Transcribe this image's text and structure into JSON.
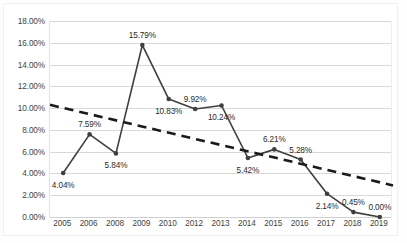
{
  "chart_data": {
    "type": "line",
    "title": "",
    "xlabel": "",
    "ylabel": "",
    "categories": [
      "2005",
      "2006",
      "2008",
      "2009",
      "2010",
      "2012",
      "2013",
      "2014",
      "2015",
      "2016",
      "2017",
      "2018",
      "2019"
    ],
    "values": [
      4.04,
      7.59,
      5.84,
      15.79,
      10.83,
      9.92,
      10.24,
      5.42,
      6.21,
      5.28,
      2.14,
      0.45,
      0.0
    ],
    "data_labels": [
      "4.04%",
      "7.59%",
      "5.84%",
      "15.79%",
      "10.83%",
      "9.92%",
      "10.24%",
      "5.42%",
      "6.21%",
      "5.28%",
      "2.14%",
      "0.45%",
      "0.00%"
    ],
    "label_positions": [
      "below",
      "above",
      "below",
      "above",
      "below",
      "above",
      "below",
      "below",
      "above",
      "above",
      "below",
      "above",
      "above"
    ],
    "ylim": [
      0,
      18
    ],
    "ytick_step": 2,
    "ytick_labels": [
      "0.00%",
      "2.00%",
      "4.00%",
      "6.00%",
      "8.00%",
      "10.00%",
      "12.00%",
      "14.00%",
      "16.00%",
      "18.00%"
    ],
    "ytick_values": [
      0,
      2,
      4,
      6,
      8,
      10,
      12,
      14,
      16,
      18
    ],
    "grid": "horizontal",
    "legend": "none",
    "series": [
      {
        "name": "series-1",
        "style": "solid-line-with-markers",
        "color": "#3f3f3f",
        "values": [
          4.04,
          7.59,
          5.84,
          15.79,
          10.83,
          9.92,
          10.24,
          5.42,
          6.21,
          5.28,
          2.14,
          0.45,
          0.0
        ]
      },
      {
        "name": "linear-trendline",
        "style": "dashed-line",
        "color": "#1a1a1a",
        "endpoints": [
          10.3,
          2.9
        ]
      }
    ],
    "colors": {
      "line": "#3f3f3f",
      "trendline": "#1a1a1a",
      "gridline": "#d9d9d9",
      "axis_text": "#3f3f3f",
      "label_text": "#2b2b2b",
      "background": "#ffffff",
      "frame": "#f0f0f0"
    }
  }
}
